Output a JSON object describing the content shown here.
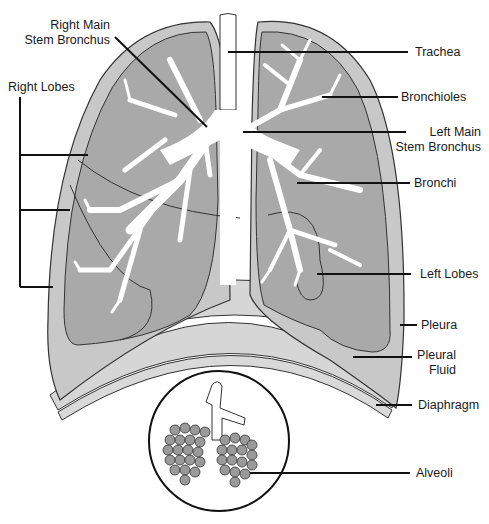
{
  "diagram": {
    "colors": {
      "lung_outer": "#c8c8c8",
      "lung_inner": "#a9a9a9",
      "pleura_fluid": "#d6d6d6",
      "airway": "#ffffff",
      "outline": "#333333",
      "leader": "#111111",
      "alveoli": "#9a9a9a"
    },
    "labels": {
      "right_main_stem_bronchus_1": "Right Main",
      "right_main_stem_bronchus_2": "Stem Bronchus",
      "right_lobes": "Right Lobes",
      "trachea": "Trachea",
      "bronchioles": "Bronchioles",
      "left_main_stem_bronchus_1": "Left Main",
      "left_main_stem_bronchus_2": "Stem Bronchus",
      "bronchi": "Bronchi",
      "left_lobes": "Left Lobes",
      "pleura": "Pleura",
      "pleural_fluid_1": "Pleural",
      "pleural_fluid_2": "Fluid",
      "diaphragm": "Diaphragm",
      "alveoli": "Alveoli"
    }
  }
}
